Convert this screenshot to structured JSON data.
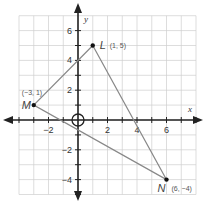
{
  "diagram": {
    "type": "coordinate-plane-triangle",
    "grid": {
      "xmin": -4,
      "xmax": 8,
      "ymin": -5,
      "ymax": 7,
      "color": "#cfcfcf"
    },
    "axes": {
      "x_label": "x",
      "y_label": "y",
      "x_ticks": [
        {
          "value": -2,
          "label": "−2"
        },
        {
          "value": 2,
          "label": "2"
        },
        {
          "value": 4,
          "label": "4"
        },
        {
          "value": 6,
          "label": "6"
        }
      ],
      "y_ticks": [
        {
          "value": 6,
          "label": "6"
        },
        {
          "value": 4,
          "label": "4"
        },
        {
          "value": 2,
          "label": "2"
        },
        {
          "value": -2,
          "label": "−2"
        },
        {
          "value": -4,
          "label": "−4"
        }
      ],
      "color": "#222222"
    },
    "origin_marker": "circle",
    "triangle": {
      "stroke": "#888888",
      "vertices": [
        {
          "name": "L",
          "x": 1,
          "y": 5,
          "label": "(1, 5)"
        },
        {
          "name": "M",
          "x": -3,
          "y": 1,
          "label": "(−3, 1)"
        },
        {
          "name": "N",
          "x": 6,
          "y": -4,
          "label": "(6, −4)"
        }
      ]
    }
  }
}
